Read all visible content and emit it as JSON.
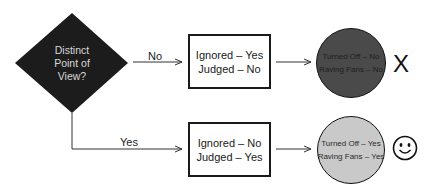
{
  "decision": {
    "lines": [
      "Distinct",
      "Point of",
      "View?"
    ]
  },
  "branches": {
    "no": {
      "label": "No",
      "box": {
        "line1": "Ignored – Yes",
        "line2": "Judged – No"
      },
      "outcome": {
        "line1": "Turned Off – No",
        "line2": "Raving Fans – No",
        "color": "#4a4a4a"
      },
      "result_icon": "x-mark",
      "result_text": "X"
    },
    "yes": {
      "label": "Yes",
      "box": {
        "line1": "Ignored – No",
        "line2": "Judged – Yes"
      },
      "outcome": {
        "line1": "Turned Off – Yes",
        "line2": "Raving Fans – Yes",
        "color": "#c9c9c9"
      },
      "result_icon": "smiley-face"
    }
  }
}
